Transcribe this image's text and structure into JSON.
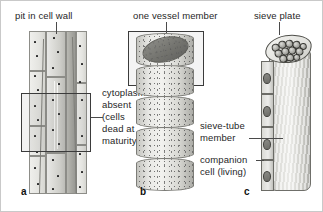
{
  "figure": {
    "background_color": "#ffffff",
    "border_color": "#c9c9c9",
    "label_color": "#1f1f1f",
    "leader_color": "#4a4a4a"
  },
  "panels": [
    {
      "letter": "a",
      "name": "xylem-tracheids-longitudinal-section",
      "labels": [
        {
          "name": "pit-in-cell-wall",
          "text": "pit in cell wall",
          "leader": "vertical"
        },
        {
          "name": "cytoplasm-absent",
          "lines": [
            "cytoplasm",
            "absent",
            "(cells",
            "dead at",
            "maturity)"
          ],
          "leader": "horizontal"
        }
      ]
    },
    {
      "letter": "b",
      "name": "xylem-vessel-members",
      "labels": [
        {
          "name": "one-vessel-member",
          "text": "one vessel member",
          "leader": "vertical"
        }
      ]
    },
    {
      "letter": "c",
      "name": "phloem-sieve-tube",
      "labels": [
        {
          "name": "sieve-plate",
          "text": "sieve plate",
          "leader": "vertical"
        },
        {
          "name": "sieve-tube-member",
          "lines": [
            "sieve-tube",
            "member"
          ],
          "leader": "horizontal"
        },
        {
          "name": "companion-cell",
          "lines": [
            "companion",
            "cell (living)"
          ],
          "leader": "horizontal"
        }
      ]
    }
  ],
  "text": {
    "pit_in_cell_wall": "pit in cell wall",
    "cytoplasm_line1": "cytoplasm",
    "cytoplasm_line2": "absent",
    "cytoplasm_line3": "(cells",
    "cytoplasm_line4": "dead at",
    "cytoplasm_line5": "maturity)",
    "one_vessel_member": "one vessel member",
    "sieve_plate": "sieve plate",
    "sieve_tube_line1": "sieve-tube",
    "sieve_tube_line2": "member",
    "companion_line1": "companion",
    "companion_line2": "cell (living)",
    "letter_a": "a",
    "letter_b": "b",
    "letter_c": "c"
  }
}
